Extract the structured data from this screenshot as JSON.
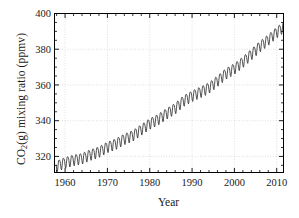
{
  "chart_data": {
    "type": "line",
    "title": "",
    "subtitle": "",
    "xlabel": "Year",
    "ylabel": "CO2(g) mixing ratio (ppmv)",
    "ylabel_parts": {
      "pre": "CO",
      "sub": "2",
      "post": "(g) mixing ratio (ppmv)"
    },
    "xlim": [
      1957.5,
      2011.6
    ],
    "ylim": [
      311.0,
      400.0
    ],
    "xticks": [
      1960,
      1970,
      1980,
      1990,
      2000,
      2010
    ],
    "xticklabels": [
      "1960",
      "1970",
      "1980",
      "1990",
      "2000",
      "2010"
    ],
    "yticks": [
      320,
      340,
      360,
      380,
      400
    ],
    "yticklabels": [
      "320",
      "340",
      "360",
      "380",
      "400"
    ],
    "x_minor_interval": 2,
    "y_minor_interval": 5,
    "grid": "dotted-both",
    "grid_color": "#c8c8c8",
    "line_color": "#262626",
    "line_width": 0.8,
    "frame_color": "#000000",
    "legend": "none",
    "annotations": [],
    "series": [
      {
        "name": "Mauna Loa monthly mean CO2",
        "description": "Keeling curve: rising trend with annual seasonal sawtooth of about 6 ppmv peak-to-peak",
        "trend_anchors": [
          {
            "year": 1958.0,
            "ppmv": 315.0
          },
          {
            "year": 1960.0,
            "ppmv": 316.9
          },
          {
            "year": 1962.0,
            "ppmv": 318.3
          },
          {
            "year": 1964.0,
            "ppmv": 319.2
          },
          {
            "year": 1966.0,
            "ppmv": 321.3
          },
          {
            "year": 1968.0,
            "ppmv": 322.9
          },
          {
            "year": 1970.0,
            "ppmv": 325.6
          },
          {
            "year": 1972.0,
            "ppmv": 327.4
          },
          {
            "year": 1974.0,
            "ppmv": 330.1
          },
          {
            "year": 1976.0,
            "ppmv": 332.0
          },
          {
            "year": 1978.0,
            "ppmv": 335.3
          },
          {
            "year": 1980.0,
            "ppmv": 338.7
          },
          {
            "year": 1982.0,
            "ppmv": 341.1
          },
          {
            "year": 1984.0,
            "ppmv": 344.4
          },
          {
            "year": 1986.0,
            "ppmv": 347.2
          },
          {
            "year": 1988.0,
            "ppmv": 351.5
          },
          {
            "year": 1990.0,
            "ppmv": 354.2
          },
          {
            "year": 1992.0,
            "ppmv": 356.4
          },
          {
            "year": 1994.0,
            "ppmv": 358.8
          },
          {
            "year": 1996.0,
            "ppmv": 362.6
          },
          {
            "year": 1998.0,
            "ppmv": 366.7
          },
          {
            "year": 2000.0,
            "ppmv": 369.5
          },
          {
            "year": 2002.0,
            "ppmv": 373.2
          },
          {
            "year": 2004.0,
            "ppmv": 377.5
          },
          {
            "year": 2006.0,
            "ppmv": 381.9
          },
          {
            "year": 2008.0,
            "ppmv": 385.6
          },
          {
            "year": 2010.0,
            "ppmv": 389.9
          },
          {
            "year": 2011.5,
            "ppmv": 392.5
          }
        ],
        "seasonal_amplitude_ppmv": 3.0,
        "seasonal_peak_month": 5,
        "sampling": "monthly"
      }
    ]
  }
}
